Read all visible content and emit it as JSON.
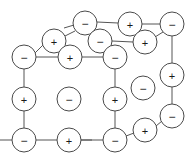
{
  "figure": {
    "width": 194,
    "height": 162,
    "background_color": "#ffffff",
    "bond_color": "#555555",
    "ion_outline_color": "#4a4a4a",
    "ion_fill_color": "#ffffff",
    "label_color": "#1a1a1a"
  },
  "legend": {
    "positive_symbol": "+",
    "negative_symbol": "−",
    "positive_name": "cation",
    "negative_name": "anion"
  },
  "ions": [
    {
      "id": "ion-top-back-mid",
      "label": "−",
      "charge": "negative",
      "cx": 85,
      "cy": 23,
      "r": 12
    },
    {
      "id": "ion-top-back-right",
      "label": "+",
      "charge": "positive",
      "cx": 130,
      "cy": 24,
      "r": 12
    },
    {
      "id": "ion-top-back-corner",
      "label": "−",
      "charge": "negative",
      "cx": 172,
      "cy": 24,
      "r": 12
    },
    {
      "id": "ion-top-left-back",
      "label": "+",
      "charge": "positive",
      "cx": 54,
      "cy": 41,
      "r": 12
    },
    {
      "id": "ion-top-mid-inner",
      "label": "−",
      "charge": "negative",
      "cx": 100,
      "cy": 41,
      "r": 12
    },
    {
      "id": "ion-top-right-inner",
      "label": "+",
      "charge": "positive",
      "cx": 145,
      "cy": 42,
      "r": 12
    },
    {
      "id": "ion-top-left-front",
      "label": "−",
      "charge": "negative",
      "cx": 24,
      "cy": 57,
      "r": 12
    },
    {
      "id": "ion-top-front-mid",
      "label": "+",
      "charge": "positive",
      "cx": 70,
      "cy": 57,
      "r": 12
    },
    {
      "id": "ion-top-front-right",
      "label": "−",
      "charge": "negative",
      "cx": 115,
      "cy": 57,
      "r": 12
    },
    {
      "id": "ion-right-upper",
      "label": "+",
      "charge": "positive",
      "cx": 172,
      "cy": 75,
      "r": 12
    },
    {
      "id": "ion-interior-right",
      "label": "−",
      "charge": "negative",
      "cx": 143,
      "cy": 88,
      "r": 12
    },
    {
      "id": "ion-left-mid",
      "label": "+",
      "charge": "positive",
      "cx": 24,
      "cy": 99,
      "r": 12
    },
    {
      "id": "ion-body-center",
      "label": "−",
      "charge": "negative",
      "cx": 69,
      "cy": 99,
      "r": 12
    },
    {
      "id": "ion-front-edge-mid",
      "label": "+",
      "charge": "positive",
      "cx": 115,
      "cy": 99,
      "r": 12
    },
    {
      "id": "ion-right-lower",
      "label": "−",
      "charge": "negative",
      "cx": 172,
      "cy": 116,
      "r": 12
    },
    {
      "id": "ion-bottom-back",
      "label": "+",
      "charge": "positive",
      "cx": 145,
      "cy": 130,
      "r": 12
    },
    {
      "id": "ion-bottom-left",
      "label": "−",
      "charge": "negative",
      "cx": 24,
      "cy": 140,
      "r": 12
    },
    {
      "id": "ion-bottom-mid",
      "label": "+",
      "charge": "positive",
      "cx": 69,
      "cy": 140,
      "r": 12
    },
    {
      "id": "ion-bottom-right",
      "label": "−",
      "charge": "negative",
      "cx": 115,
      "cy": 140,
      "r": 12
    }
  ],
  "bonds": [
    {
      "id": "bond-top-back-mid-to-right",
      "x1": 97,
      "y1": 22,
      "x2": 118,
      "y2": 23
    },
    {
      "id": "bond-top-back-right-to-corner",
      "x1": 142,
      "y1": 24,
      "x2": 160,
      "y2": 24
    },
    {
      "id": "bond-top-left-back-to-mid",
      "x1": 65,
      "y1": 36,
      "x2": 75,
      "y2": 31
    },
    {
      "id": "bond-top-mid-inner-to-right",
      "x1": 112,
      "y1": 41,
      "x2": 133,
      "y2": 42
    },
    {
      "id": "bond-top-right-inner-to-corner",
      "x1": 155,
      "y1": 37,
      "x2": 163,
      "y2": 32
    },
    {
      "id": "bond-left-front-to-left-back",
      "x1": 35,
      "y1": 53,
      "x2": 43,
      "y2": 45
    },
    {
      "id": "bond-left-front-to-front-mid",
      "x1": 36,
      "y1": 57,
      "x2": 58,
      "y2": 57
    },
    {
      "id": "bond-front-mid-to-front-right",
      "x1": 82,
      "y1": 57,
      "x2": 103,
      "y2": 57
    },
    {
      "id": "bond-top-left-back-to-front-mid",
      "x1": 59,
      "y1": 52,
      "x2": 65,
      "y2": 46
    },
    {
      "id": "bond-top-mid-inner-to-front-right",
      "x1": 105,
      "y1": 52,
      "x2": 110,
      "y2": 46
    },
    {
      "id": "bond-corner-to-right-upper",
      "x1": 172,
      "y1": 36,
      "x2": 172,
      "y2": 63
    },
    {
      "id": "bond-right-upper-to-right-lower",
      "x1": 172,
      "y1": 87,
      "x2": 172,
      "y2": 104
    },
    {
      "id": "bond-left-front-to-left-mid",
      "x1": 24,
      "y1": 69,
      "x2": 24,
      "y2": 87
    },
    {
      "id": "bond-left-mid-to-bottom-left",
      "x1": 24,
      "y1": 111,
      "x2": 24,
      "y2": 128
    },
    {
      "id": "bond-front-right-to-front-edge",
      "x1": 115,
      "y1": 69,
      "x2": 115,
      "y2": 87
    },
    {
      "id": "bond-front-edge-to-bottom-right",
      "x1": 115,
      "y1": 111,
      "x2": 115,
      "y2": 128
    },
    {
      "id": "bond-bottom-left-to-mid",
      "x1": 36,
      "y1": 140,
      "x2": 57,
      "y2": 140
    },
    {
      "id": "bond-bottom-mid-to-right",
      "x1": 81,
      "y1": 140,
      "x2": 103,
      "y2": 140
    },
    {
      "id": "bond-bottom-right-to-back",
      "x1": 126,
      "y1": 136,
      "x2": 134,
      "y2": 133
    },
    {
      "id": "bond-bottom-back-to-right-lower",
      "x1": 156,
      "y1": 126,
      "x2": 162,
      "y2": 121
    },
    {
      "id": "bond-bottom-right-stub",
      "x1": 0,
      "y1": 140,
      "x2": 12,
      "y2": 140
    },
    {
      "id": "bond-bottom-mid-stub-right",
      "x1": 81,
      "y1": 140,
      "x2": 92,
      "y2": 140
    },
    {
      "id": "bond-top-back-mid-stub-left",
      "x1": 64,
      "y1": 28,
      "x2": 74,
      "y2": 25
    }
  ]
}
